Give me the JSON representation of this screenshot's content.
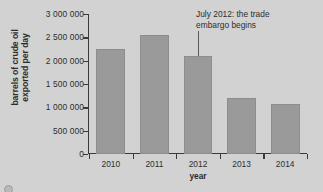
{
  "chart_data": {
    "type": "bar",
    "title": "",
    "xlabel": "year",
    "ylabel": "barrels of crude oil exported per day",
    "ylabel_lines": [
      "barrels of crude oil",
      "exported per day"
    ],
    "categories": [
      "2010",
      "2011",
      "2012",
      "2013",
      "2014"
    ],
    "values": [
      2250000,
      2540000,
      2100000,
      1200000,
      1080000
    ],
    "ylim": [
      0,
      3000000
    ],
    "ytick_values": [
      0,
      500000,
      1000000,
      1500000,
      2000000,
      2500000,
      3000000
    ],
    "ytick_labels": [
      "0",
      "500 000",
      "1 000 000",
      "1 500 000",
      "2 000 000",
      "2 500 000",
      "3 000 000"
    ],
    "grid": false,
    "legend": null,
    "bar_color": "#9a9a9a",
    "axis_color": "#3a3a3a",
    "background_color": "#d2d2d2",
    "annotations": [
      {
        "text_lines": [
          "July 2012: the trade",
          "embargo begins"
        ],
        "text": "July 2012: the trade embargo begins",
        "points_to_category": "2012",
        "has_leader_line": true
      }
    ]
  },
  "footer": {
    "sliver_text": ""
  }
}
